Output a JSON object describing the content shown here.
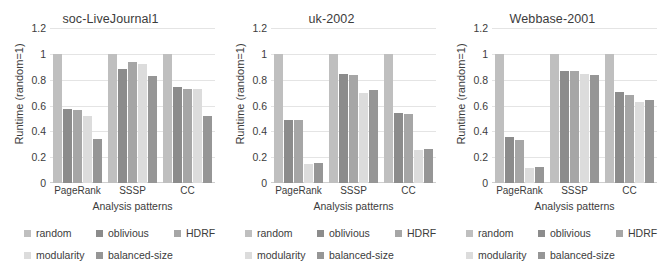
{
  "chart_data": [
    {
      "type": "bar",
      "title": "soc-LiveJournal1",
      "xlabel": "Analysis patterns",
      "ylabel": "Runtime (random=1)",
      "ylim": [
        0,
        1.2
      ],
      "yticks": [
        "0",
        "0.2",
        "0.4",
        "0.6",
        "0.8",
        "1",
        "1.2"
      ],
      "ytick_values": [
        0,
        0.2,
        0.4,
        0.6,
        0.8,
        1,
        1.2
      ],
      "grid": true,
      "legend_position": "bottom",
      "categories": [
        "PageRank",
        "SSSP",
        "CC"
      ],
      "series": [
        {
          "name": "random",
          "color": "#bfbfbf",
          "values": [
            1.0,
            1.0,
            1.0
          ]
        },
        {
          "name": "oblivious",
          "color": "#8c8c8c",
          "values": [
            0.57,
            0.885,
            0.745
          ]
        },
        {
          "name": "HDRF",
          "color": "#a6a6a6",
          "values": [
            0.565,
            0.94,
            0.73
          ]
        },
        {
          "name": "modularity",
          "color": "#dcdcdc",
          "values": [
            0.515,
            0.92,
            0.73
          ]
        },
        {
          "name": "balanced-size",
          "color": "#969696",
          "values": [
            0.34,
            0.83,
            0.515
          ]
        }
      ]
    },
    {
      "type": "bar",
      "title": "uk-2002",
      "xlabel": "Analysis patterns",
      "ylabel": "Runtime (random=1)",
      "ylim": [
        0,
        1.2
      ],
      "yticks": [
        "0",
        "0.2",
        "0.4",
        "0.6",
        "0.8",
        "1",
        "1.2"
      ],
      "ytick_values": [
        0,
        0.2,
        0.4,
        0.6,
        0.8,
        1,
        1.2
      ],
      "grid": true,
      "legend_position": "bottom",
      "categories": [
        "PageRank",
        "SSSP",
        "CC"
      ],
      "series": [
        {
          "name": "random",
          "color": "#bfbfbf",
          "values": [
            1.0,
            1.0,
            1.0
          ]
        },
        {
          "name": "oblivious",
          "color": "#8c8c8c",
          "values": [
            0.49,
            0.845,
            0.54
          ]
        },
        {
          "name": "HDRF",
          "color": "#a6a6a6",
          "values": [
            0.49,
            0.835,
            0.535
          ]
        },
        {
          "name": "modularity",
          "color": "#dcdcdc",
          "values": [
            0.145,
            0.695,
            0.255
          ]
        },
        {
          "name": "balanced-size",
          "color": "#969696",
          "values": [
            0.155,
            0.72,
            0.26
          ]
        }
      ]
    },
    {
      "type": "bar",
      "title": "Webbase-2001",
      "xlabel": "Analysis patterns",
      "ylabel": "Runtime (random=1)",
      "ylim": [
        0,
        1.2
      ],
      "yticks": [
        "0",
        "0.2",
        "0.4",
        "0.6",
        "0.8",
        "1",
        "1.2"
      ],
      "ytick_values": [
        0,
        0.2,
        0.4,
        0.6,
        0.8,
        1,
        1.2
      ],
      "grid": true,
      "legend_position": "bottom",
      "categories": [
        "PageRank",
        "SSSP",
        "CC"
      ],
      "series": [
        {
          "name": "random",
          "color": "#bfbfbf",
          "values": [
            1.0,
            1.0,
            1.0
          ]
        },
        {
          "name": "oblivious",
          "color": "#8c8c8c",
          "values": [
            0.36,
            0.87,
            0.705
          ]
        },
        {
          "name": "HDRF",
          "color": "#a6a6a6",
          "values": [
            0.33,
            0.87,
            0.685
          ]
        },
        {
          "name": "modularity",
          "color": "#dcdcdc",
          "values": [
            0.115,
            0.845,
            0.63
          ]
        },
        {
          "name": "balanced-size",
          "color": "#969696",
          "values": [
            0.125,
            0.84,
            0.645
          ]
        }
      ]
    }
  ]
}
